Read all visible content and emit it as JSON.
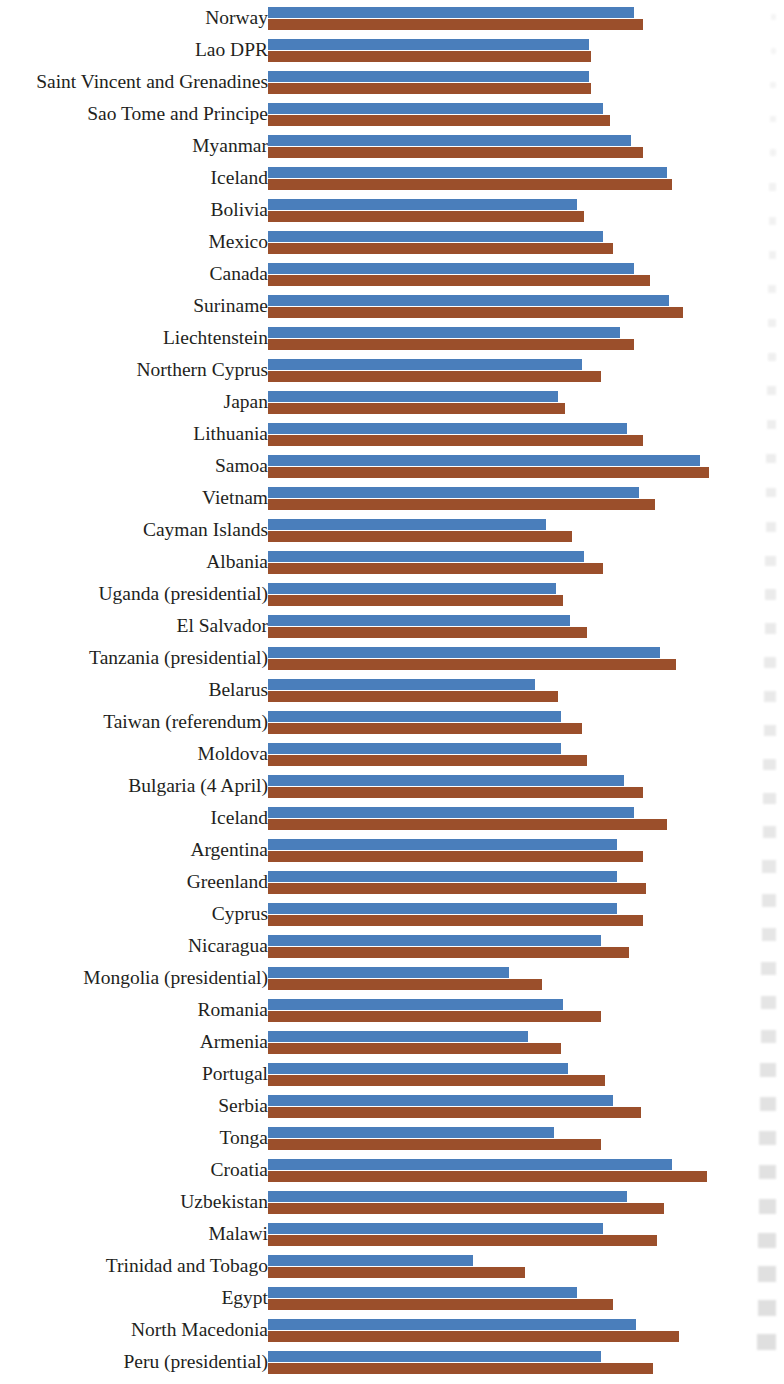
{
  "chart_data": {
    "type": "bar",
    "orientation": "horizontal",
    "title": "",
    "subtitle": "",
    "xlabel": "",
    "ylabel": "",
    "grid": false,
    "legend": null,
    "axis_visible": false,
    "tick_labels": [],
    "xlim": [
      0,
      100
    ],
    "colors": {
      "series_1": "#4a7ebb",
      "series_2": "#9b4f2b",
      "label_text": "#231f1d",
      "background": "#ffffff"
    },
    "series": [
      {
        "name": "series_1",
        "color": "#4a7ebb"
      },
      {
        "name": "series_2",
        "color": "#9b4f2b"
      }
    ],
    "categories": [
      "Norway",
      "Lao DPR",
      "Saint Vincent and Grenadines",
      "Sao Tome and Principe",
      "Myanmar",
      "Iceland",
      "Bolivia",
      "Mexico",
      "Canada",
      "Suriname",
      "Liechtenstein",
      "Northern Cyprus",
      "Japan",
      "Lithuania",
      "Samoa",
      "Vietnam",
      "Cayman Islands",
      "Albania",
      "Uganda (presidential)",
      "El Salvador",
      "Tanzania (presidential)",
      "Belarus",
      "Taiwan (referendum)",
      "Moldova",
      "Bulgaria (4 April)",
      "Iceland",
      "Argentina",
      "Greenland",
      "Cyprus",
      "Nicaragua",
      "Mongolia (presidential)",
      "Romania",
      "Armenia",
      "Portugal",
      "Serbia",
      "Tonga",
      "Croatia",
      "Uzbekistan",
      "Malawi",
      "Trinidad and Tobago",
      "Egypt",
      "North Macedonia",
      "Peru (presidential)"
    ],
    "values_series_1": [
      77.5,
      68.0,
      68.0,
      71.0,
      77.0,
      84.5,
      65.5,
      71.0,
      77.5,
      85.0,
      74.5,
      66.5,
      61.5,
      76.0,
      91.5,
      78.5,
      59.0,
      67.0,
      61.0,
      64.0,
      83.0,
      56.5,
      62.0,
      62.0,
      75.5,
      77.5,
      74.0,
      74.0,
      74.0,
      70.5,
      51.0,
      62.5,
      55.0,
      63.5,
      73.0,
      60.5,
      85.5,
      76.0,
      71.0,
      43.5,
      65.5,
      78.0,
      70.5
    ],
    "values_series_2": [
      79.5,
      68.5,
      68.5,
      72.5,
      79.5,
      85.5,
      67.0,
      73.0,
      81.0,
      88.0,
      77.5,
      70.5,
      63.0,
      79.5,
      93.5,
      82.0,
      64.5,
      71.0,
      62.5,
      67.5,
      86.5,
      61.5,
      66.5,
      67.5,
      79.5,
      84.5,
      79.5,
      80.0,
      79.5,
      76.5,
      58.0,
      70.5,
      62.0,
      71.5,
      79.0,
      70.5,
      93.0,
      84.0,
      82.5,
      54.5,
      73.0,
      87.0,
      81.5
    ]
  },
  "edge_artifacts": {
    "description": "faint gray illegible smudges at right page edge",
    "count": 40
  }
}
